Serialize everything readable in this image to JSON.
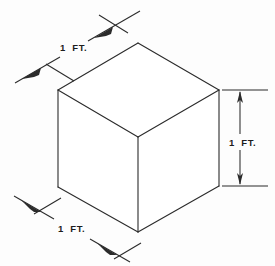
{
  "figure": {
    "background_color": "#fdfdfd",
    "line_color": "#2b2b2b",
    "text_color": "#1d1d1d",
    "face_fill": "#ffffff"
  },
  "shape": {
    "name": "cube",
    "projection": "isometric",
    "vertices": {
      "top_apex": {
        "x": 138,
        "y": 43
      },
      "top_left": {
        "x": 58,
        "y": 90
      },
      "top_right": {
        "x": 219,
        "y": 90
      },
      "front_center_top": {
        "x": 138,
        "y": 137
      },
      "bottom_left": {
        "x": 58,
        "y": 187
      },
      "bottom_right": {
        "x": 219,
        "y": 186
      },
      "front_center_bottom": {
        "x": 138,
        "y": 232
      }
    }
  },
  "dimensions": [
    {
      "id": "top-left-edge",
      "label": "1  FT.",
      "value": 1,
      "unit": "FT.",
      "orientation": "diagonal-up-right",
      "label_position": {
        "x": 60,
        "y": 51
      }
    },
    {
      "id": "right-vertical-edge",
      "label": "1  FT.",
      "value": 1,
      "unit": "FT.",
      "orientation": "vertical",
      "label_position": {
        "x": 229,
        "y": 143
      }
    },
    {
      "id": "bottom-left-edge",
      "label": "1  FT.",
      "value": 1,
      "unit": "FT.",
      "orientation": "diagonal-down-right",
      "label_position": {
        "x": 58,
        "y": 229
      }
    }
  ]
}
